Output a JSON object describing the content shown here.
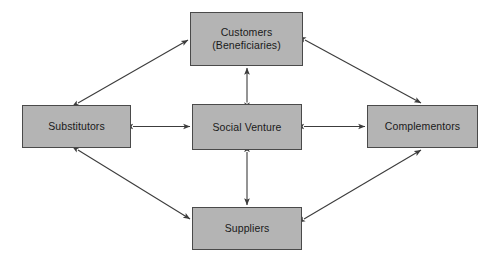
{
  "diagram": {
    "type": "node-link-diagram",
    "background_color": "#ffffff",
    "node_fill_color": "#b4b4b4",
    "node_border_color": "#4a4a4a",
    "edge_color": "#4a4a4a",
    "nodes": [
      {
        "id": "customers",
        "label": "Customers\n(Beneficiaries)",
        "line1": "Customers",
        "line2": "(Beneficiaries)",
        "position": "top-center"
      },
      {
        "id": "substitutors",
        "label": "Substitutors",
        "position": "middle-left"
      },
      {
        "id": "social-venture",
        "label": "Social Venture",
        "position": "center"
      },
      {
        "id": "complementors",
        "label": "Complementors",
        "position": "middle-right"
      },
      {
        "id": "suppliers",
        "label": "Suppliers",
        "position": "bottom-center"
      }
    ],
    "edges": [
      {
        "from": "social-venture",
        "to": "customers",
        "style": "double-arrow",
        "orientation": "vertical"
      },
      {
        "from": "social-venture",
        "to": "suppliers",
        "style": "double-arrow",
        "orientation": "vertical"
      },
      {
        "from": "social-venture",
        "to": "substitutors",
        "style": "double-arrow",
        "orientation": "horizontal"
      },
      {
        "from": "social-venture",
        "to": "complementors",
        "style": "double-arrow",
        "orientation": "horizontal"
      },
      {
        "from": "substitutors",
        "to": "customers",
        "style": "double-arrow",
        "orientation": "diagonal"
      },
      {
        "from": "customers",
        "to": "complementors",
        "style": "double-arrow",
        "orientation": "diagonal"
      },
      {
        "from": "substitutors",
        "to": "suppliers",
        "style": "double-arrow",
        "orientation": "diagonal"
      },
      {
        "from": "suppliers",
        "to": "complementors",
        "style": "double-arrow",
        "orientation": "diagonal"
      }
    ]
  }
}
